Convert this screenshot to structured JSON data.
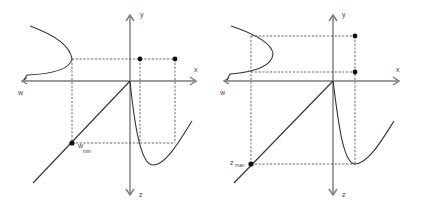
{
  "panels": [
    {
      "id": "left",
      "axes": {
        "x_label": "x",
        "y_label": "y",
        "z_label": "z",
        "w_label": "w"
      },
      "marker_label": "w",
      "marker_subscript": "min"
    },
    {
      "id": "right",
      "axes": {
        "x_label": "x",
        "y_label": "y",
        "z_label": "z",
        "w_label": "w"
      },
      "marker_label": "z",
      "marker_subscript": "max"
    }
  ],
  "colors": {
    "axis": "#7a7a7a",
    "curve": "#333333",
    "dashed": "#555555",
    "dot": "#111111"
  }
}
